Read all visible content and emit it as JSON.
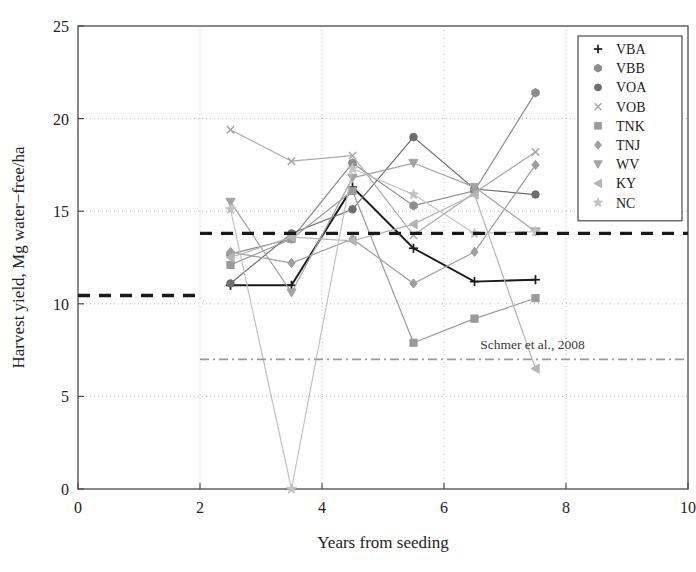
{
  "chart_data": {
    "type": "line",
    "title": "",
    "xlabel": "Years from seeding",
    "ylabel": "Harvest yield, Mg water−free/ha",
    "xlim": [
      0,
      10
    ],
    "ylim": [
      0,
      25
    ],
    "xticks": [
      0,
      2,
      4,
      6,
      8,
      10
    ],
    "yticks": [
      0,
      5,
      10,
      15,
      20,
      25
    ],
    "grid": true,
    "legend_position": "top-right",
    "series": [
      {
        "name": "VBA",
        "marker": "plus",
        "color": "#1a1a1a",
        "x": [
          2.5,
          3.5,
          4.5,
          5.5,
          6.5,
          7.5
        ],
        "values": [
          11.0,
          11.0,
          16.3,
          13.0,
          11.2,
          11.3
        ]
      },
      {
        "name": "VBB",
        "marker": "hexagon",
        "color": "#8c8c8c",
        "x": [
          2.5,
          3.5,
          4.5,
          5.5,
          6.5,
          7.5
        ],
        "values": [
          12.7,
          13.5,
          17.6,
          15.3,
          16.1,
          21.4
        ]
      },
      {
        "name": "VOA",
        "marker": "circle",
        "color": "#6e6e6e",
        "x": [
          2.5,
          3.5,
          4.5,
          5.5,
          6.5,
          7.5
        ],
        "values": [
          11.1,
          13.8,
          15.1,
          19.0,
          16.2,
          15.9
        ]
      },
      {
        "name": "VOB",
        "marker": "cross",
        "color": "#a8a8a8",
        "x": [
          2.5,
          3.5,
          4.5,
          5.5,
          6.5,
          7.5
        ],
        "values": [
          19.4,
          17.7,
          18.0,
          13.7,
          16.0,
          18.2
        ]
      },
      {
        "name": "TNK",
        "marker": "square",
        "color": "#9a9a9a",
        "x": [
          2.5,
          3.5,
          4.5,
          5.5,
          6.5,
          7.5
        ],
        "values": [
          12.1,
          13.5,
          16.1,
          7.9,
          9.2,
          10.3
        ]
      },
      {
        "name": "TNJ",
        "marker": "diamond",
        "color": "#9e9e9e",
        "x": [
          2.5,
          3.5,
          4.5,
          5.5,
          6.5,
          7.5
        ],
        "values": [
          12.8,
          12.2,
          13.5,
          11.1,
          12.8,
          17.5
        ]
      },
      {
        "name": "WV",
        "marker": "triangle-down",
        "color": "#a3a3a3",
        "x": [
          2.5,
          3.5,
          4.5,
          5.5,
          6.5,
          7.5
        ],
        "values": [
          15.5,
          10.6,
          16.8,
          17.6,
          16.3,
          13.9
        ]
      },
      {
        "name": "KY",
        "marker": "triangle-left",
        "color": "#b5b5b5",
        "x": [
          2.5,
          3.5,
          4.5,
          5.5,
          6.5,
          7.5
        ],
        "values": [
          12.5,
          13.6,
          13.4,
          14.3,
          15.9,
          6.5
        ]
      },
      {
        "name": "NC",
        "marker": "star",
        "color": "#c2c2c2",
        "x": [
          2.5,
          3.5,
          4.5,
          5.5,
          6.5,
          7.5
        ],
        "values": [
          15.1,
          0.0,
          17.3,
          15.9,
          13.8,
          13.9
        ]
      }
    ],
    "reference_lines": [
      {
        "name": "dashed-low",
        "style": "dashed",
        "color": "#1a1a1a",
        "y": 10.45,
        "x_start": 0.0,
        "x_end": 2.0,
        "label": ""
      },
      {
        "name": "dashed-high",
        "style": "dashed",
        "color": "#1a1a1a",
        "y": 13.8,
        "x_start": 2.0,
        "x_end": 10.0,
        "label": ""
      },
      {
        "name": "schmer",
        "style": "dashdot",
        "color": "#9a9a9a",
        "y": 7.0,
        "x_start": 2.0,
        "x_end": 10.0,
        "label": "Schmer et al., 2008"
      }
    ],
    "annotations": [
      {
        "name": "schmer-annotation",
        "text": "Schmer et al., 2008",
        "x": 7.45,
        "y": 7.55
      }
    ],
    "legend": {
      "entries": [
        {
          "label": "VBA",
          "marker": "plus",
          "color": "#1a1a1a"
        },
        {
          "label": "VBB",
          "marker": "hexagon",
          "color": "#8c8c8c"
        },
        {
          "label": "VOA",
          "marker": "circle",
          "color": "#6e6e6e"
        },
        {
          "label": "VOB",
          "marker": "cross",
          "color": "#a8a8a8"
        },
        {
          "label": "TNK",
          "marker": "square",
          "color": "#9a9a9a"
        },
        {
          "label": "TNJ",
          "marker": "diamond",
          "color": "#9e9e9e"
        },
        {
          "label": "WV",
          "marker": "triangle-down",
          "color": "#a3a3a3"
        },
        {
          "label": "KY",
          "marker": "triangle-left",
          "color": "#b5b5b5"
        },
        {
          "label": "NC",
          "marker": "star",
          "color": "#c2c2c2"
        }
      ]
    }
  }
}
